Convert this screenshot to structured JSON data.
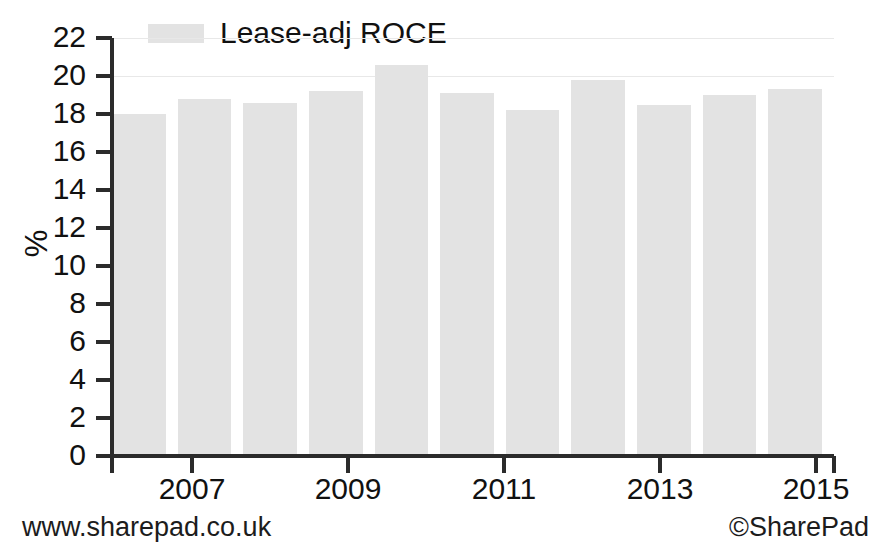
{
  "chart_data": {
    "type": "bar",
    "title": "",
    "xlabel": "",
    "ylabel": "%",
    "ylim": [
      0,
      22
    ],
    "ytick_step": 2,
    "yticks": [
      22,
      20,
      18,
      16,
      14,
      12,
      10,
      8,
      6,
      4,
      2,
      0
    ],
    "grid": true,
    "gridlines_at": [
      22,
      20
    ],
    "legend_position": "top-left",
    "legend": [
      "Lease-adj ROCE"
    ],
    "categories": [
      "2006",
      "2007",
      "2008",
      "2009",
      "2010",
      "2011",
      "2012",
      "2013",
      "2014",
      "2015",
      "2016"
    ],
    "xtick_labels": [
      "2007",
      "2009",
      "2011",
      "2013",
      "2015"
    ],
    "series": [
      {
        "name": "Lease-adj ROCE",
        "color": "#e3e3e3",
        "values": [
          18.0,
          18.8,
          18.6,
          19.2,
          20.6,
          19.1,
          18.2,
          19.8,
          18.5,
          19.0,
          19.3
        ]
      }
    ]
  },
  "legend": {
    "swatch_name": "legend-color-swatch",
    "label": "Lease-adj ROCE"
  },
  "axes": {
    "y_title": "%",
    "y_labels": [
      "22",
      "20",
      "18",
      "16",
      "14",
      "12",
      "10",
      "8",
      "6",
      "4",
      "2",
      "0"
    ],
    "x_labels": [
      "2007",
      "2009",
      "2011",
      "2013",
      "2015"
    ]
  },
  "footer": {
    "website": "www.sharepad.co.uk",
    "copyright": "©SharePad"
  },
  "colors": {
    "bar_fill": "#e3e3e3",
    "axis": "#2b2b2b",
    "gridline": "#e8e8e8",
    "text": "#111111",
    "background": "#ffffff"
  }
}
